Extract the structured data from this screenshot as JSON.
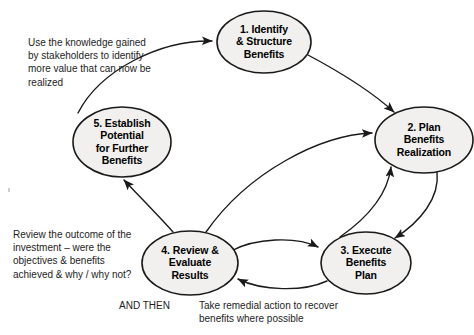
{
  "diagram": {
    "colors": {
      "node_fill": "#f1f0ee",
      "node_stroke": "#1a1a1a",
      "arrow_stroke": "#1a1a1a",
      "text": "#000000",
      "background": "#ffffff"
    },
    "nodes": [
      {
        "id": "node-1",
        "label": "1. Identify\n& Structure\nBenefits",
        "cx": 264,
        "cy": 42,
        "rx": 47,
        "ry": 31
      },
      {
        "id": "node-2",
        "label": "2. Plan\nBenefits\nRealization",
        "cx": 424,
        "cy": 140,
        "rx": 49,
        "ry": 33
      },
      {
        "id": "node-3",
        "label": "3. Execute\nBenefits\nPlan",
        "cx": 366,
        "cy": 263,
        "rx": 45,
        "ry": 31
      },
      {
        "id": "node-4",
        "label": "4. Review &\nEvaluate\nResults",
        "cx": 190,
        "cy": 263,
        "rx": 48,
        "ry": 32
      },
      {
        "id": "node-5",
        "label": "5. Establish\nPotential\nfor Further\nBenefits",
        "cx": 122,
        "cy": 142,
        "rx": 49,
        "ry": 35
      }
    ],
    "connectors": [
      {
        "id": "arrow-5-to-1",
        "from": "node-5",
        "to": "node-1"
      },
      {
        "id": "arrow-1-to-2",
        "from": "node-1",
        "to": "node-2"
      },
      {
        "id": "arrow-2-to-3",
        "from": "node-2",
        "to": "node-3"
      },
      {
        "id": "arrow-3-to-2",
        "from": "node-3",
        "to": "node-2"
      },
      {
        "id": "arrow-4-to-3",
        "from": "node-4",
        "to": "node-3"
      },
      {
        "id": "arrow-3-to-4",
        "from": "node-3",
        "to": "node-4"
      },
      {
        "id": "arrow-4-to-5",
        "from": "node-4",
        "to": "node-5"
      },
      {
        "id": "arrow-4-to-2",
        "from": "node-4",
        "to": "node-2"
      }
    ],
    "annotations": [
      {
        "id": "annotation-knowledge",
        "text": "Use the knowledge gained\nby stakeholders to identify\nmore value that can now be\nrealized"
      },
      {
        "id": "annotation-review",
        "text": "Review the outcome of the\ninvestment – were the\nobjectives & benefits\nachieved & why / why not?"
      }
    ],
    "captions": [
      {
        "id": "caption-and-then",
        "text": "AND THEN"
      },
      {
        "id": "caption-remedial",
        "text": "Take remedial action to recover\nbenefits where possible"
      }
    ]
  }
}
